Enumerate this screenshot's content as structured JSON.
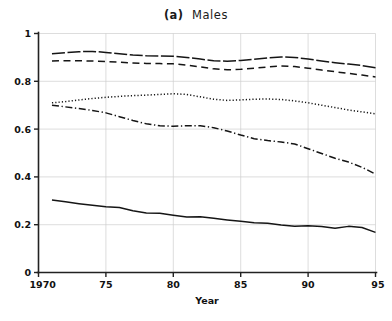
{
  "figure": {
    "panel_label": "(a)",
    "title": "Males",
    "width": 392,
    "height": 321
  },
  "axes": {
    "x_title": "Year",
    "y_title": "",
    "x_ticks": [
      "1970",
      "75",
      "80",
      "85",
      "90",
      "95"
    ],
    "y_ticks": [
      "0",
      "0.2",
      "0.4",
      "0.6",
      "0.8",
      "1"
    ],
    "grid": "horizontal-and-vertical"
  },
  "colors": {
    "line": "#151515",
    "grid": "#cfcfcf",
    "axis": "#222222",
    "background": "#ffffff"
  },
  "chart_data": {
    "type": "line",
    "xlabel": "Year",
    "ylabel": "",
    "xlim": [
      1970,
      1995
    ],
    "ylim": [
      0,
      1
    ],
    "xticks": [
      1970,
      1975,
      1980,
      1985,
      1990,
      1995
    ],
    "xticklabels": [
      "1970",
      "75",
      "80",
      "85",
      "90",
      "95"
    ],
    "yticks": [
      0,
      0.2,
      0.4,
      0.6,
      0.8,
      1
    ],
    "yticklabels": [
      "0",
      "0.2",
      "0.4",
      "0.6",
      "0.8",
      "1"
    ],
    "grid": true,
    "legend": "none",
    "x": [
      1971,
      1972,
      1973,
      1974,
      1975,
      1976,
      1977,
      1978,
      1979,
      1980,
      1981,
      1982,
      1983,
      1984,
      1985,
      1986,
      1987,
      1988,
      1989,
      1990,
      1991,
      1992,
      1993,
      1994,
      1995
    ],
    "series": [
      {
        "name": "series-1",
        "style": "long-dash",
        "values": [
          0.915,
          0.92,
          0.924,
          0.925,
          0.921,
          0.915,
          0.91,
          0.907,
          0.906,
          0.905,
          0.9,
          0.893,
          0.886,
          0.884,
          0.887,
          0.892,
          0.898,
          0.902,
          0.9,
          0.893,
          0.885,
          0.878,
          0.872,
          0.866,
          0.857
        ]
      },
      {
        "name": "series-2",
        "style": "dashed",
        "values": [
          0.885,
          0.886,
          0.886,
          0.885,
          0.883,
          0.88,
          0.877,
          0.875,
          0.874,
          0.873,
          0.868,
          0.86,
          0.852,
          0.848,
          0.85,
          0.855,
          0.86,
          0.864,
          0.862,
          0.855,
          0.847,
          0.84,
          0.833,
          0.826,
          0.818
        ]
      },
      {
        "name": "series-3",
        "style": "dotted",
        "values": [
          0.71,
          0.715,
          0.722,
          0.728,
          0.733,
          0.737,
          0.74,
          0.742,
          0.745,
          0.748,
          0.745,
          0.735,
          0.725,
          0.72,
          0.722,
          0.725,
          0.726,
          0.724,
          0.718,
          0.71,
          0.7,
          0.69,
          0.68,
          0.672,
          0.664
        ]
      },
      {
        "name": "series-4",
        "style": "dash-dot",
        "values": [
          0.7,
          0.693,
          0.686,
          0.678,
          0.668,
          0.652,
          0.636,
          0.622,
          0.614,
          0.612,
          0.614,
          0.614,
          0.606,
          0.592,
          0.575,
          0.56,
          0.552,
          0.546,
          0.538,
          0.518,
          0.498,
          0.478,
          0.462,
          0.44,
          0.412
        ]
      },
      {
        "name": "series-5",
        "style": "solid",
        "values": [
          0.303,
          0.296,
          0.288,
          0.281,
          0.275,
          0.272,
          0.258,
          0.249,
          0.248,
          0.24,
          0.232,
          0.233,
          0.227,
          0.22,
          0.214,
          0.208,
          0.206,
          0.199,
          0.194,
          0.196,
          0.192,
          0.185,
          0.193,
          0.188,
          0.168
        ]
      }
    ]
  }
}
